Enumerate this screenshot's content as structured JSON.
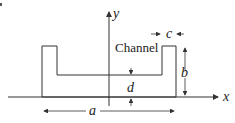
{
  "diagram": {
    "title_label": "Channel",
    "axes": {
      "x_label": "x",
      "y_label": "y"
    },
    "dimensions": {
      "width_label": "a",
      "height_label": "b",
      "flange_label": "c",
      "thickness_label": "d"
    },
    "colors": {
      "line": "#333333",
      "background": "#ffffff"
    }
  }
}
